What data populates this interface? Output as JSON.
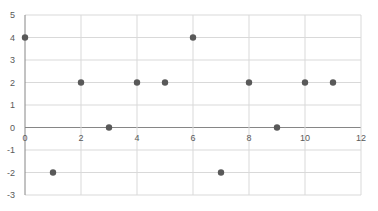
{
  "chart_data": {
    "type": "scatter",
    "title": "",
    "xlabel": "",
    "ylabel": "",
    "xlim": [
      0,
      12
    ],
    "ylim": [
      -3,
      5
    ],
    "x_ticks": [
      0,
      2,
      4,
      6,
      8,
      10,
      12
    ],
    "y_ticks": [
      -3,
      -2,
      -1,
      0,
      1,
      2,
      3,
      4,
      5
    ],
    "grid": true,
    "legend": "none",
    "series": [
      {
        "name": "Series1",
        "color": "#595959",
        "points": [
          {
            "x": 0,
            "y": 4
          },
          {
            "x": 1,
            "y": -2
          },
          {
            "x": 2,
            "y": 2
          },
          {
            "x": 3,
            "y": 0
          },
          {
            "x": 4,
            "y": 2
          },
          {
            "x": 5,
            "y": 2
          },
          {
            "x": 6,
            "y": 4
          },
          {
            "x": 7,
            "y": -2
          },
          {
            "x": 8,
            "y": 2
          },
          {
            "x": 9,
            "y": 0
          },
          {
            "x": 10,
            "y": 2
          },
          {
            "x": 11,
            "y": 2
          }
        ]
      }
    ]
  },
  "colors": {
    "grid": "#d9d9d9",
    "axis": "#868686",
    "marker": "#595959",
    "tick_text": "#595959"
  }
}
